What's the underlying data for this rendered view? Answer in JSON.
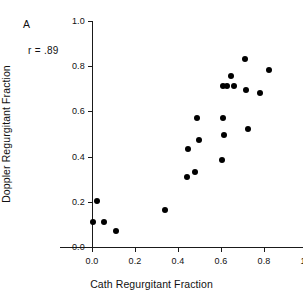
{
  "chart_data": {
    "type": "scatter",
    "title": "",
    "panel_label": "A",
    "xlabel": "Cath Regurgitant Fraction",
    "ylabel": "Doppler Regurgitant Fraction",
    "xlim": [
      0.0,
      1.0
    ],
    "ylim": [
      0.0,
      1.0
    ],
    "xticks": [
      "0.0",
      "0.2",
      "0.4",
      "0.6",
      "0.8",
      "1.0"
    ],
    "xtick_values": [
      0.0,
      0.2,
      0.4,
      0.6,
      0.8,
      1.0
    ],
    "yticks": [
      "0.0",
      "0.2",
      "0.4",
      "0.6",
      "0.8",
      "1.0"
    ],
    "ytick_values": [
      0.0,
      0.2,
      0.4,
      0.6,
      0.8,
      1.0
    ],
    "grid": false,
    "legend": "none",
    "annotations": [
      {
        "text": "A",
        "x": 0.06,
        "y": 0.95
      },
      {
        "text": "r = .89",
        "x": 0.09,
        "y": 0.83
      }
    ],
    "correlation": "r = .89",
    "marker": {
      "shape": "circle",
      "color": "#000000",
      "size": 6
    },
    "points": [
      {
        "x": 0.005,
        "y": 0.112
      },
      {
        "x": 0.025,
        "y": 0.202
      },
      {
        "x": 0.055,
        "y": 0.112
      },
      {
        "x": 0.11,
        "y": 0.072
      },
      {
        "x": 0.34,
        "y": 0.163
      },
      {
        "x": 0.44,
        "y": 0.31
      },
      {
        "x": 0.445,
        "y": 0.433
      },
      {
        "x": 0.478,
        "y": 0.332
      },
      {
        "x": 0.487,
        "y": 0.572
      },
      {
        "x": 0.498,
        "y": 0.474
      },
      {
        "x": 0.605,
        "y": 0.383
      },
      {
        "x": 0.608,
        "y": 0.572
      },
      {
        "x": 0.612,
        "y": 0.494
      },
      {
        "x": 0.607,
        "y": 0.712
      },
      {
        "x": 0.628,
        "y": 0.712
      },
      {
        "x": 0.645,
        "y": 0.755
      },
      {
        "x": 0.66,
        "y": 0.712
      },
      {
        "x": 0.712,
        "y": 0.833
      },
      {
        "x": 0.715,
        "y": 0.693
      },
      {
        "x": 0.727,
        "y": 0.523
      },
      {
        "x": 0.782,
        "y": 0.683
      },
      {
        "x": 0.822,
        "y": 0.785
      }
    ]
  }
}
